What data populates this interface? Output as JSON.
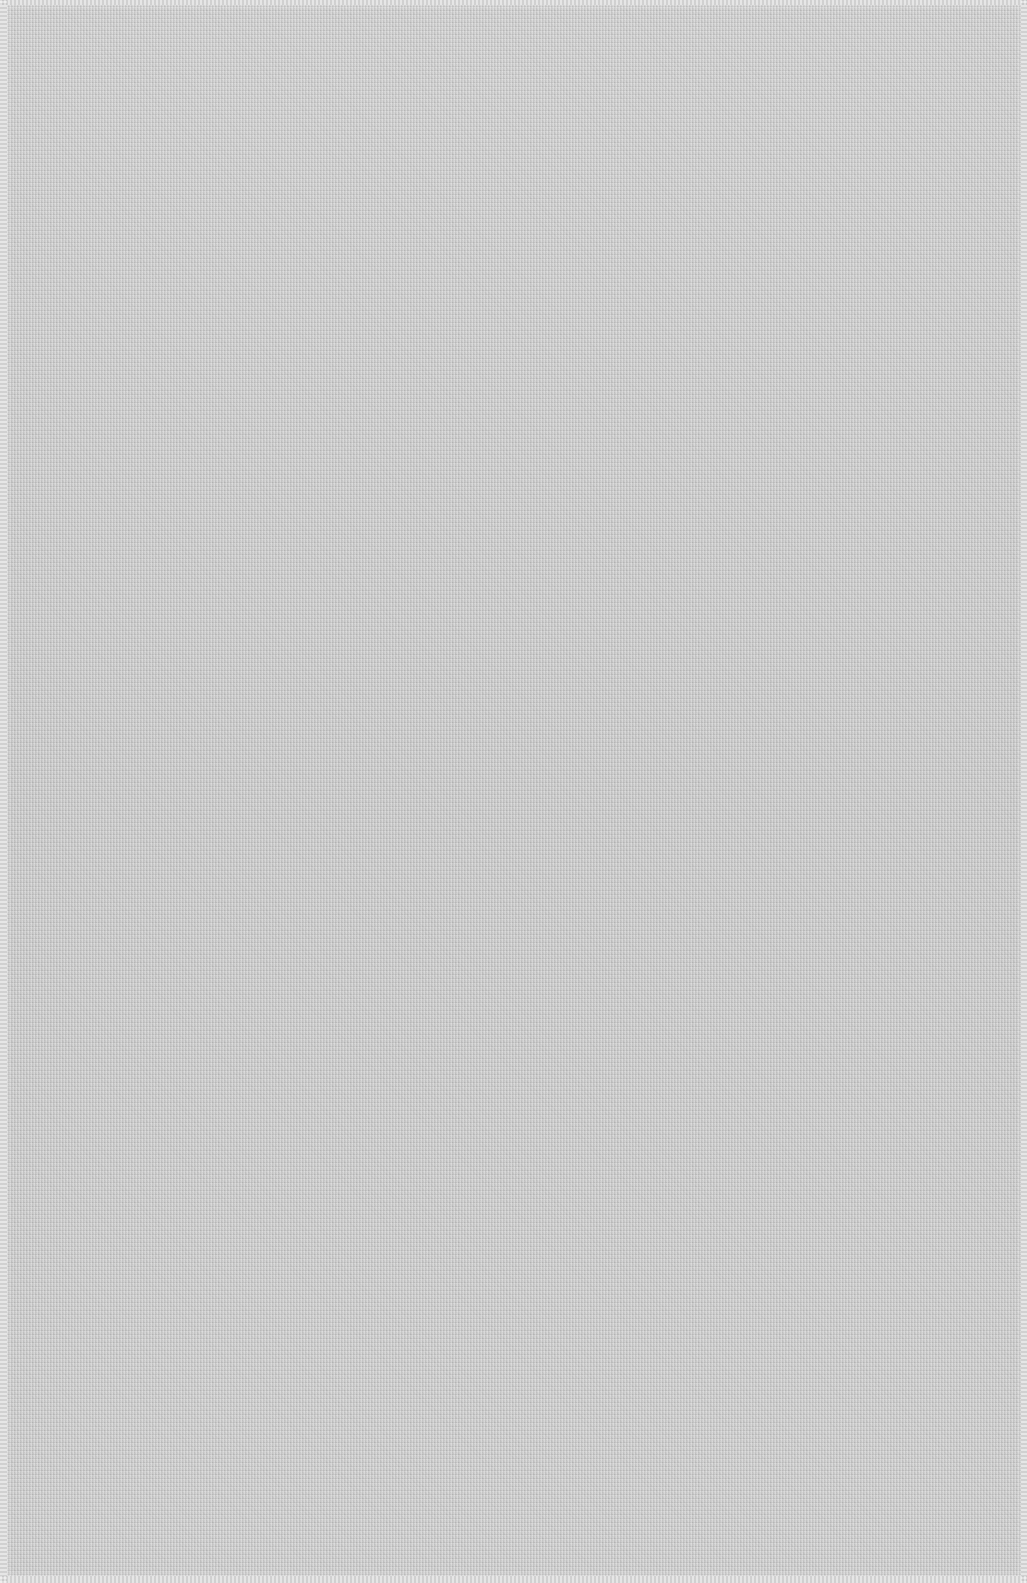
{
  "image": {
    "subject": "plain woven fabric swatch",
    "texture": "fine weave",
    "colors": {
      "fabric": "#cdcdcd",
      "edge": "#d9d9d9"
    }
  }
}
